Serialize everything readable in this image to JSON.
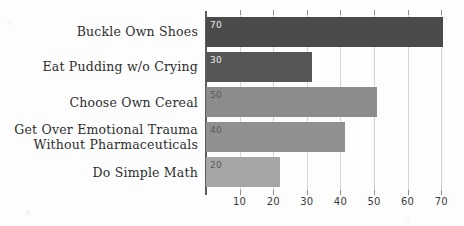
{
  "chart_data": {
    "type": "bar",
    "orientation": "horizontal",
    "title": "",
    "xlabel": "",
    "ylabel": "",
    "xlim": [
      0,
      75
    ],
    "grid": true,
    "legend": false,
    "xticks": [
      10,
      20,
      30,
      40,
      50,
      60,
      70
    ],
    "categories": [
      "Buckle Own Shoes",
      "Eat Pudding w/o Crying",
      "Choose Own Cereal",
      "Get Over Emotional Trauma\nWithout Pharmaceuticals",
      "Do Simple Math"
    ],
    "values": [
      70,
      30,
      50,
      40,
      20
    ],
    "bar_labels": [
      "70",
      "30",
      "50",
      "40",
      "20"
    ],
    "drawn_lengths": [
      70.5,
      31.5,
      51.0,
      41.5,
      22.0
    ],
    "bar_colors": [
      "#4b4b4b",
      "#565656",
      "#8c8c8c",
      "#909090",
      "#a6a6a6"
    ],
    "axis_color": "#5d5d5d",
    "gridline_color": "#d3d3d3",
    "background_color": "#fdfdfd"
  }
}
